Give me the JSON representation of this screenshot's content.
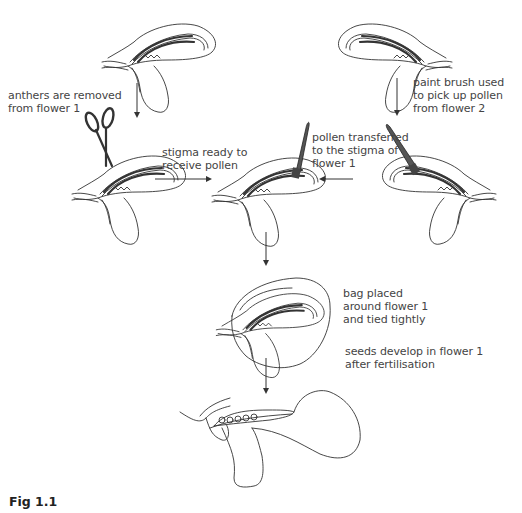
{
  "diagram": {
    "caption": "Fig 1.1",
    "top_cutoff_text": "(partially cut-off text line above diagram)",
    "nodes": [
      {
        "id": "flower1_original",
        "label": "flower 1"
      },
      {
        "id": "flower2_original",
        "label": "flower 2"
      },
      {
        "id": "flower1_emasculated",
        "label": "flower 1 with scissors"
      },
      {
        "id": "flower1_receiving",
        "label": "flower 1 with paint brush"
      },
      {
        "id": "flower2_brush",
        "label": "flower 2 with paint brush"
      },
      {
        "id": "flower1_bagged",
        "label": "bagged flower 1"
      },
      {
        "id": "flower1_seeds",
        "label": "flower 1 cross-section with seeds"
      }
    ],
    "labels": {
      "anthers_removed": "anthers are removed\nfrom flower 1",
      "paint_brush": "paint brush used\nto pick up pollen\nfrom flower 2",
      "stigma_ready": "stigma ready to\nreceive pollen",
      "pollen_transferred": "pollen transferred\nto the stigma of\nflower 1",
      "bag_placed": "bag placed\naround flower 1\nand tied tightly",
      "seeds_develop": "seeds develop in flower 1\nafter fertilisation"
    },
    "edges": [
      {
        "from": "flower1_original",
        "to": "flower1_emasculated",
        "label": "anthers are removed from flower 1"
      },
      {
        "from": "flower2_original",
        "to": "flower2_brush",
        "label": "paint brush used to pick up pollen from flower 2"
      },
      {
        "from": "flower1_emasculated",
        "to": "flower1_receiving",
        "label": "stigma ready to receive pollen"
      },
      {
        "from": "flower2_brush",
        "to": "flower1_receiving",
        "label": "pollen transferred to the stigma of flower 1"
      },
      {
        "from": "flower1_receiving",
        "to": "flower1_bagged",
        "label": "bag placed around flower 1 and tied tightly"
      },
      {
        "from": "flower1_bagged",
        "to": "flower1_seeds",
        "label": "seeds develop in flower 1 after fertilisation"
      }
    ],
    "icons": [
      "scissors-icon",
      "paint-brush-icon",
      "flower-icon",
      "bag-icon",
      "arrow-down-icon",
      "arrow-right-icon",
      "arrow-left-icon"
    ],
    "colors": {
      "line": "#333333",
      "text": "#444444",
      "background": "#ffffff"
    }
  }
}
